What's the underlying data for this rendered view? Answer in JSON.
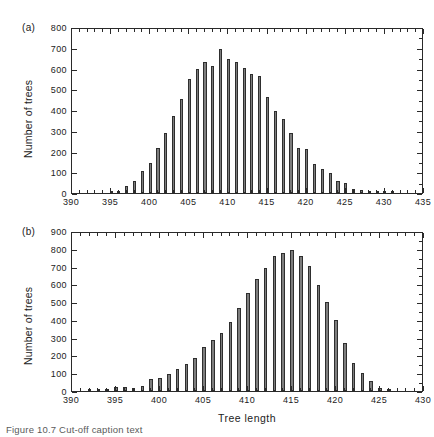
{
  "figure": {
    "caption": "Figure 10.7  Cut-off caption text",
    "xlabel": "Tree  length",
    "ylabel": "Number of trees"
  },
  "panels": {
    "a": {
      "tag": "(a)",
      "ylabel": "Number of trees",
      "ytick_labels": [
        "0",
        "100",
        "200",
        "300",
        "400",
        "500",
        "600",
        "700",
        "800"
      ],
      "xtick_labels": [
        "390",
        "395",
        "400",
        "405",
        "410",
        "415",
        "420",
        "425",
        "430",
        "435"
      ]
    },
    "b": {
      "tag": "(b)",
      "ylabel": "Number of trees",
      "xlabel": "Tree  length",
      "ytick_labels": [
        "0",
        "100",
        "200",
        "300",
        "400",
        "500",
        "600",
        "700",
        "800",
        "900"
      ],
      "xtick_labels": [
        "390",
        "395",
        "400",
        "405",
        "410",
        "415",
        "420",
        "425",
        "430"
      ]
    }
  },
  "chart_data": [
    {
      "type": "bar",
      "panel": "a",
      "title": "",
      "xlabel": "",
      "ylabel": "Number of trees",
      "xlim": [
        390,
        435
      ],
      "ylim": [
        0,
        800
      ],
      "ytick_step": 100,
      "xtick_step": 5,
      "xminor_step": 1,
      "grid": false,
      "legend": false,
      "categories": [
        395,
        396,
        397,
        398,
        399,
        400,
        401,
        402,
        403,
        404,
        405,
        406,
        407,
        408,
        409,
        410,
        411,
        412,
        413,
        414,
        415,
        416,
        417,
        418,
        419,
        420,
        421,
        422,
        423,
        424,
        425,
        426,
        427,
        428,
        429,
        430,
        431
      ],
      "values": [
        4,
        12,
        33,
        57,
        108,
        147,
        215,
        290,
        372,
        455,
        549,
        598,
        632,
        613,
        693,
        648,
        631,
        604,
        573,
        565,
        462,
        396,
        357,
        288,
        219,
        212,
        141,
        114,
        95,
        59,
        48,
        18,
        16,
        12,
        7,
        9,
        6
      ]
    },
    {
      "type": "bar",
      "panel": "b",
      "title": "",
      "xlabel": "Tree  length",
      "ylabel": "Number of trees",
      "xlim": [
        390,
        430
      ],
      "ylim": [
        0,
        900
      ],
      "ytick_step": 100,
      "xtick_step": 5,
      "xminor_step": 1,
      "grid": false,
      "legend": false,
      "categories": [
        392,
        393,
        394,
        395,
        396,
        397,
        398,
        399,
        400,
        401,
        402,
        403,
        404,
        405,
        406,
        407,
        408,
        409,
        410,
        411,
        412,
        413,
        414,
        415,
        416,
        417,
        418,
        419,
        420,
        421,
        422,
        423,
        424,
        425,
        426
      ],
      "values": [
        5,
        4,
        4,
        22,
        21,
        19,
        31,
        70,
        75,
        94,
        125,
        153,
        188,
        248,
        288,
        325,
        388,
        467,
        551,
        631,
        692,
        759,
        777,
        795,
        757,
        702,
        595,
        500,
        400,
        268,
        155,
        100,
        55,
        16,
        14
      ]
    }
  ]
}
